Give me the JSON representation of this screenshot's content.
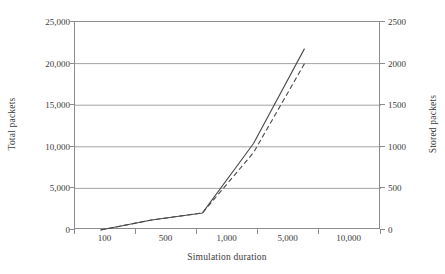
{
  "figure": {
    "background": "#ffffff",
    "ink": "#3c3c3c",
    "axis_color": "#8c8c8c",
    "grid_color": "#8c8c8c"
  },
  "chart_data": {
    "type": "line",
    "title": "",
    "xlabel": "Simulation duration",
    "ylabel": "Total packets",
    "y2label": "Stored packets",
    "grid": "horizontal",
    "legend": "none",
    "x_scale": "categorical-log",
    "x": [
      100,
      500,
      1000,
      5000,
      10000
    ],
    "xtick_labels": [
      "100",
      "500",
      "1,000",
      "5,000",
      "10,000"
    ],
    "ylim": [
      0,
      25000
    ],
    "ytick_labels": [
      "0",
      "5,000",
      "10,000",
      "15,000",
      "20,000",
      "25,000"
    ],
    "ytick_values": [
      0,
      5000,
      10000,
      15000,
      20000,
      25000
    ],
    "y2lim": [
      0,
      2500
    ],
    "y2tick_labels": [
      "0",
      "500",
      "1000",
      "1500",
      "2000",
      "2500"
    ],
    "y2tick_values": [
      0,
      500,
      1000,
      1500,
      2000,
      2500
    ],
    "series": [
      {
        "name": "Total packets",
        "axis": "left",
        "style": "solid",
        "color": "#4a4a4a",
        "x": [
          100,
          500,
          1000,
          5000,
          10000
        ],
        "values": [
          0,
          1200,
          2050,
          10400,
          21800
        ]
      },
      {
        "name": "Stored packets",
        "axis": "right",
        "style": "dashed",
        "color": "#4a4a4a",
        "x": [
          100,
          500,
          1000,
          5000,
          10000
        ],
        "values": [
          0,
          120,
          205,
          930,
          2000
        ]
      }
    ]
  }
}
